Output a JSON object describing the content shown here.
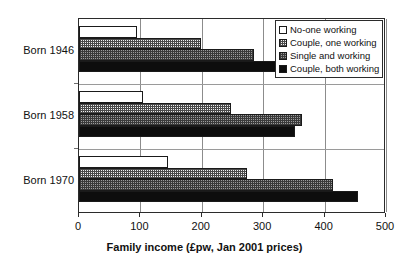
{
  "chart_data": {
    "type": "bar",
    "orientation": "horizontal",
    "title": "",
    "xlabel": "Family income (£pw, Jan 2001 prices)",
    "ylabel": "",
    "xlim": [
      0,
      500
    ],
    "xticks": [
      0,
      100,
      200,
      300,
      400,
      500
    ],
    "xticklabels": [
      "0",
      "100",
      "200",
      "300",
      "400",
      "500"
    ],
    "grid": "vertical",
    "legend_position": "top-right",
    "categories": [
      "Born 1946",
      "Born 1958",
      "Born 1970"
    ],
    "series": [
      {
        "name": "No-one working",
        "fill": "white",
        "color": "#ffffff",
        "values": [
          95,
          104,
          145
        ]
      },
      {
        "name": "Couple, one working",
        "fill": "light-crosshatch",
        "color": "#f2f2f2",
        "values": [
          199,
          247,
          273
        ]
      },
      {
        "name": "Single and working",
        "fill": "dense-crosshatch",
        "color": "#9c9c9c",
        "values": [
          285,
          363,
          413
        ]
      },
      {
        "name": "Couple, both working",
        "fill": "solid-black",
        "color": "#0d0d0d",
        "values": [
          326,
          352,
          454
        ]
      }
    ]
  },
  "legend": {
    "items": [
      {
        "label": "No-one working"
      },
      {
        "label": "Couple, one working"
      },
      {
        "label": "Single and working"
      },
      {
        "label": "Couple, both working"
      }
    ]
  },
  "axis": {
    "x_title": "Family income (£pw, Jan 2001 prices)",
    "x_tick_labels": [
      "0",
      "100",
      "200",
      "300",
      "400",
      "500"
    ],
    "y_tick_labels": [
      "Born 1946",
      "Born 1958",
      "Born 1970"
    ]
  }
}
